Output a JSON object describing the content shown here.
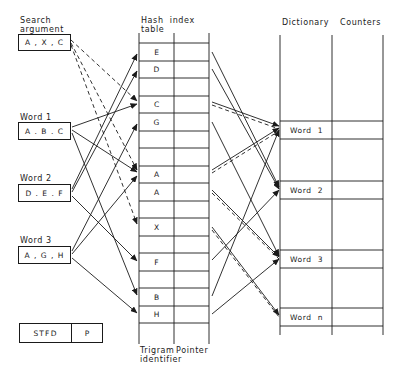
{
  "title_labels": {
    "search_argument_line1": "Search",
    "search_argument_line2": "argument",
    "hash_table_line1": "Hash  index",
    "hash_table_line2": "table",
    "dictionary": "Dictionary",
    "counters": "Counters",
    "trigram_identifier_line1": "Trigram",
    "trigram_identifier_line2": "identifier",
    "pointer": "Pointer"
  },
  "inputs": {
    "search": {
      "label": "",
      "value": "A , X , C"
    },
    "word1": {
      "label": "Word 1",
      "value": "A . B . C"
    },
    "word2": {
      "label": "Word 2",
      "value": "D . E . F"
    },
    "word3": {
      "label": "Word 3",
      "value": "A , G , H"
    }
  },
  "stfd_box": {
    "left": "STFD",
    "right": "P"
  },
  "hash_table_rows": [
    "E",
    "D",
    "",
    "C",
    "G",
    "",
    "",
    "A",
    "A",
    "",
    "X",
    "",
    "F",
    "",
    "B",
    "H",
    ""
  ],
  "dictionary_rows": [
    "Word  1",
    "Word  2",
    "Word  3",
    "Word  n"
  ],
  "edges": {
    "search_dashed": [
      "A",
      "X",
      "C"
    ],
    "word1": [
      "A",
      "B",
      "C"
    ],
    "word2": [
      "D",
      "E",
      "F"
    ],
    "word3": [
      "A",
      "G",
      "H"
    ]
  },
  "colors": {
    "ink": "#1a1a1a",
    "background": "#ffffff"
  }
}
